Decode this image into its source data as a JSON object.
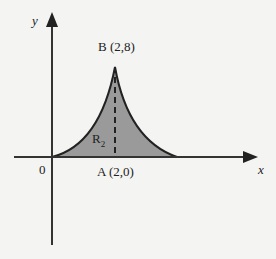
{
  "diagram": {
    "axes": {
      "x_label": "x",
      "y_label": "y",
      "origin_label": "0"
    },
    "points": {
      "B": {
        "label": "B (2,8)",
        "x": 2,
        "y": 8
      },
      "A": {
        "label": "A (2,0)",
        "x": 2,
        "y": 0
      }
    },
    "region": {
      "name": "R",
      "subscript": "2"
    },
    "colors": {
      "fill": "#9a9a9a",
      "stroke": "#222222",
      "background": "#f4f4f2"
    }
  }
}
